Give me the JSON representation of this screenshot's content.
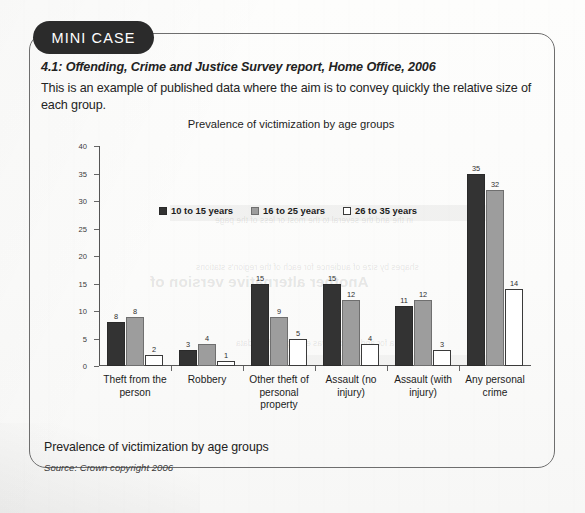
{
  "badge": {
    "label": "MINI CASE"
  },
  "case": {
    "subtitle": "4.1: Offending, Crime and Justice Survey report, Home Office, 2006",
    "body": "This is an example of published data where the aim is to convey quickly the relative size of each group."
  },
  "caption": {
    "title": "Prevalence of victimization by age groups",
    "source": "Source: Crown copyright 2006"
  },
  "bleed": {
    "heading": "Another alternative version of",
    "line1": "shapes by size of audience for each of the region's stations",
    "line2": "in the and the several to the most or less of the page",
    "line3": "a for and anyone was example of the data"
  },
  "chart_data": {
    "type": "bar",
    "title": "Prevalence of victimization by age groups",
    "xlabel": "",
    "ylabel": "Percent victimized once or more",
    "ylim": [
      0,
      40
    ],
    "yticks": [
      0,
      5,
      10,
      15,
      20,
      25,
      30,
      35,
      40
    ],
    "grid": false,
    "legend_position": "inside-top-center",
    "categories": [
      "Theft from the person",
      "Robbery",
      "Other theft of personal property",
      "Assault (no injury)",
      "Assault (with injury)",
      "Any personal crime"
    ],
    "series": [
      {
        "name": "10 to 15 years",
        "color": "#333333",
        "values": [
          8,
          3,
          15,
          15,
          11,
          35
        ],
        "labels": [
          "8",
          "3",
          "15",
          "15",
          "11",
          "35"
        ]
      },
      {
        "name": "16 to 25 years",
        "color": "#9d9d9d",
        "values": [
          9,
          4,
          9,
          12,
          12,
          32
        ],
        "labels": [
          "8",
          "4",
          "9",
          "12",
          "12",
          "32"
        ]
      },
      {
        "name": "26 to 35 years",
        "color": "#ffffff",
        "values": [
          2,
          1,
          5,
          4,
          3,
          14
        ],
        "labels": [
          "2",
          "1",
          "5",
          "4",
          "3",
          "14"
        ]
      }
    ]
  }
}
